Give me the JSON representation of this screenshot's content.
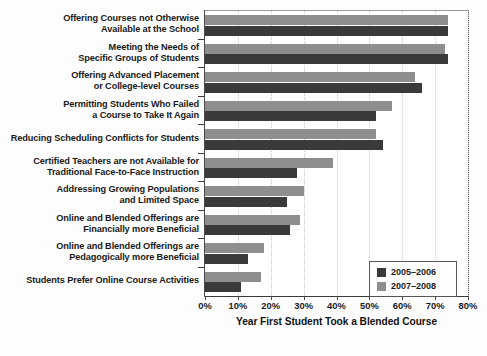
{
  "chart_data": {
    "type": "bar",
    "orientation": "horizontal",
    "title": "",
    "xlabel": "Year First Student Took a Blended Course",
    "ylabel": "",
    "xlim": [
      0,
      80
    ],
    "xticks": [
      "0%",
      "10%",
      "20%",
      "30%",
      "40%",
      "50%",
      "60%",
      "70%",
      "80%"
    ],
    "xtick_values": [
      0,
      10,
      20,
      30,
      40,
      50,
      60,
      70,
      80
    ],
    "grid": true,
    "legend_position": "bottom-right",
    "categories": [
      "Offering Courses not Otherwise Available at the School",
      "Meeting the Needs of Specific Groups of Students",
      "Offering Advanced Placement or College-level Courses",
      "Permitting Students Who Failed a Course to Take It Again",
      "Reducing Scheduling Conflicts for Students",
      "Certified Teachers are not Available for Traditional Face-to-Face Instruction",
      "Addressing Growing Populations and Limited Space",
      "Online and Blended Offerings are Financially more Beneficial",
      "Online and Blended Offerings are Pedagogically more Beneficial",
      "Students Prefer Online Course Activities"
    ],
    "category_lines": [
      [
        "Offering Courses not Otherwise",
        "Available at the School"
      ],
      [
        "Meeting the Needs of",
        "Specific Groups of Students"
      ],
      [
        "Offering Advanced Placement",
        "or College-level Courses"
      ],
      [
        "Permitting Students Who Failed",
        "a Course to Take It Again"
      ],
      [
        "Reducing Scheduling Conflicts for Students"
      ],
      [
        "Certified Teachers are not Available for",
        "Traditional Face-to-Face Instruction"
      ],
      [
        "Addressing Growing Populations",
        "and Limited Space"
      ],
      [
        "Online and Blended Offerings are",
        "Financially more Beneficial"
      ],
      [
        "Online and Blended Offerings are",
        "Pedagogically more Beneficial"
      ],
      [
        "Students Prefer Online Course Activities"
      ]
    ],
    "series": [
      {
        "name": "2005–2006",
        "color": "#3a3a38",
        "values": [
          74,
          74,
          66,
          52,
          54,
          28,
          25,
          26,
          13,
          11
        ]
      },
      {
        "name": "2007–2008",
        "color": "#8e8e8e",
        "values": [
          74,
          73,
          64,
          57,
          52,
          39,
          30,
          29,
          18,
          17
        ]
      }
    ]
  },
  "legend": {
    "items": [
      {
        "label": "2005–2006",
        "swatch": "dark"
      },
      {
        "label": "2007–2008",
        "swatch": "light"
      }
    ]
  }
}
